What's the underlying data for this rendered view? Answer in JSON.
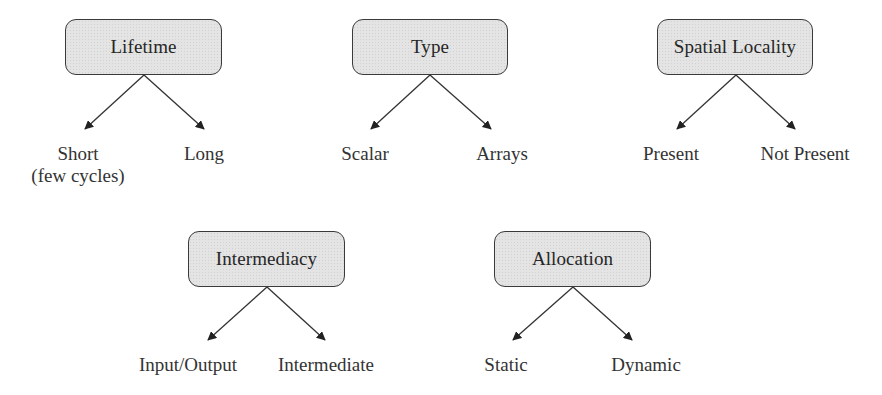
{
  "colors": {
    "node_fill": "#e4e4e4",
    "node_border": "#3a3a3a",
    "arrow": "#333333",
    "text": "#262626"
  },
  "trees": [
    {
      "root": "Lifetime",
      "box": {
        "x": 65,
        "y": 19,
        "w": 157,
        "h": 56
      },
      "apex": {
        "x": 144,
        "y": 75
      },
      "children": [
        {
          "label": "Short",
          "sublabel": "(few cycles)",
          "tip": {
            "x": 85,
            "y": 129
          },
          "cx": 78,
          "ty": 143
        },
        {
          "label": "Long",
          "sublabel": "",
          "tip": {
            "x": 204,
            "y": 129
          },
          "cx": 204,
          "ty": 143
        }
      ]
    },
    {
      "root": "Type",
      "box": {
        "x": 352,
        "y": 19,
        "w": 156,
        "h": 56
      },
      "apex": {
        "x": 430,
        "y": 75
      },
      "children": [
        {
          "label": "Scalar",
          "sublabel": "",
          "tip": {
            "x": 371,
            "y": 129
          },
          "cx": 365,
          "ty": 143
        },
        {
          "label": "Arrays",
          "sublabel": "",
          "tip": {
            "x": 491,
            "y": 129
          },
          "cx": 502,
          "ty": 143
        }
      ]
    },
    {
      "root": "Spatial Locality",
      "box": {
        "x": 657,
        "y": 19,
        "w": 156,
        "h": 56
      },
      "apex": {
        "x": 736,
        "y": 75
      },
      "children": [
        {
          "label": "Present",
          "sublabel": "",
          "tip": {
            "x": 677,
            "y": 129
          },
          "cx": 671,
          "ty": 143
        },
        {
          "label": "Not Present",
          "sublabel": "",
          "tip": {
            "x": 795,
            "y": 129
          },
          "cx": 805,
          "ty": 143
        }
      ]
    },
    {
      "root": "Intermediacy",
      "box": {
        "x": 188,
        "y": 231,
        "w": 157,
        "h": 56
      },
      "apex": {
        "x": 267,
        "y": 287
      },
      "children": [
        {
          "label": "Input/Output",
          "sublabel": "",
          "tip": {
            "x": 208,
            "y": 340
          },
          "cx": 188,
          "ty": 354
        },
        {
          "label": "Intermediate",
          "sublabel": "",
          "tip": {
            "x": 325,
            "y": 340
          },
          "cx": 326,
          "ty": 354
        }
      ]
    },
    {
      "root": "Allocation",
      "box": {
        "x": 494,
        "y": 231,
        "w": 157,
        "h": 56
      },
      "apex": {
        "x": 573,
        "y": 287
      },
      "children": [
        {
          "label": "Static",
          "sublabel": "",
          "tip": {
            "x": 513,
            "y": 340
          },
          "cx": 506,
          "ty": 354
        },
        {
          "label": "Dynamic",
          "sublabel": "",
          "tip": {
            "x": 632,
            "y": 340
          },
          "cx": 646,
          "ty": 354
        }
      ]
    }
  ]
}
